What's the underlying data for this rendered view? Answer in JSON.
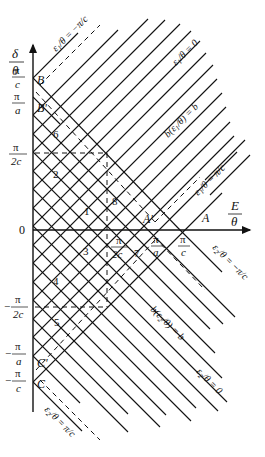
{
  "figure": {
    "axes": {
      "y_axis_label_num": "δ",
      "y_axis_label_den": "θ",
      "x_axis_label_num": "E",
      "x_axis_label_den": "θ",
      "origin": "0"
    },
    "y_ticks": [
      {
        "num": "π",
        "den": "c",
        "sign": ""
      },
      {
        "num": "π",
        "den": "a",
        "sign": ""
      },
      {
        "num": "π",
        "den": "2c",
        "sign": ""
      },
      {
        "num": "π",
        "den": "2c",
        "sign": "−"
      },
      {
        "num": "π",
        "den": "a",
        "sign": "−"
      },
      {
        "num": "π",
        "den": "c",
        "sign": "−"
      }
    ],
    "x_ticks": [
      {
        "num": "π",
        "den": "2c"
      },
      {
        "num": "π",
        "den": "a"
      },
      {
        "num": "π",
        "den": "c"
      }
    ],
    "points": {
      "B": "B",
      "B_prime": "B'",
      "A": "A",
      "A_prime": "A'",
      "C": "C",
      "C_prime": "C'"
    },
    "regions": [
      "1",
      "2",
      "3",
      "4",
      "5",
      "6",
      "7",
      "8"
    ],
    "line_labels": {
      "eps1_neg": "ε₁/θ = −π/c",
      "eps1_zero": "ε₁/θ = 0",
      "eps1_b": "b(ε₁/θ) = b",
      "eps1_pos": "ε₁/θ = π/c",
      "eps2_neg": "ε₂/θ = −π/c",
      "eps2_b": "b(ε₂/θ) = b",
      "eps2_zero": "ε₂/θ = 0",
      "eps2_pos": "ε₂/θ = π/c"
    },
    "line_label_parts": {
      "eps1": "ε",
      "sub1": "1",
      "eps2": "ε",
      "sub2": "2",
      "theta": "θ",
      "eq": "=",
      "zero": "0",
      "b": "b",
      "minus_pi": "−π",
      "pi": "π",
      "c": "c"
    }
  }
}
